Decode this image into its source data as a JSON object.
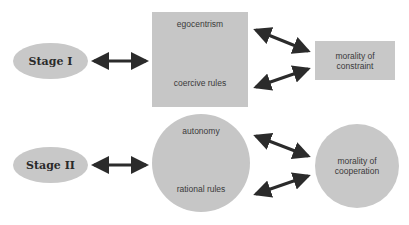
{
  "diagram": {
    "stage1": {
      "label": "Stage I",
      "mechanism_top": "egocentrism",
      "mechanism_bottom": "coercive rules",
      "outcome": "morality of constraint"
    },
    "stage2": {
      "label": "Stage II",
      "mechanism_top": "autonomy",
      "mechanism_bottom": "rational rules",
      "outcome": "morality of cooperation"
    },
    "colors": {
      "shape_fill": "#c8c8c8",
      "arrow": "#2b2b2b",
      "text": "#333333"
    }
  }
}
